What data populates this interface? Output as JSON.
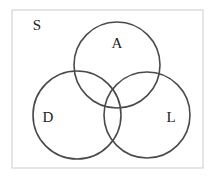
{
  "diagram": {
    "type": "venn",
    "universe": {
      "label": "S",
      "rect": {
        "x": 12,
        "y": 10,
        "width": 191,
        "height": 158
      },
      "label_pos": {
        "x": 37,
        "y": 25
      }
    },
    "sets": [
      {
        "id": "A",
        "label": "A",
        "cx": 117,
        "cy": 65,
        "r": 43,
        "label_pos": {
          "x": 117,
          "y": 43
        }
      },
      {
        "id": "D",
        "label": "D",
        "cx": 77,
        "cy": 115,
        "r": 44,
        "label_pos": {
          "x": 48,
          "y": 117
        }
      },
      {
        "id": "L",
        "label": "L",
        "cx": 147,
        "cy": 115,
        "r": 43,
        "label_pos": {
          "x": 171,
          "y": 117
        }
      }
    ],
    "colors": {
      "circle_stroke": "#4a4a4a",
      "universe_stroke": "#d4d4d4",
      "text": "#222222",
      "background": "#ffffff"
    }
  }
}
